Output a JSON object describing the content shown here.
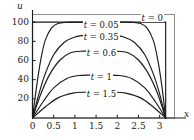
{
  "chart_data": {
    "type": "line",
    "title": "",
    "xlabel": "x",
    "ylabel": "u",
    "xlim": [
      0,
      3.35
    ],
    "ylim": [
      0,
      108
    ],
    "grid": false,
    "legend_position": "inline-on-curves",
    "xticks": [
      0,
      0.5,
      1,
      1.5,
      2,
      2.5,
      3
    ],
    "xtick_labels": [
      "0",
      "0.5",
      "1",
      "1.5",
      "2",
      "2.5",
      "3"
    ],
    "yticks": [
      20,
      40,
      60,
      80,
      100
    ],
    "ytick_labels": [
      "20",
      "40",
      "60",
      "80",
      "100"
    ],
    "domain_end": 3.14159,
    "series": [
      {
        "name": "t = 0",
        "t": 0,
        "label": "t = 0",
        "label_t": "t",
        "label_eq": "=",
        "label_value": "0",
        "peak": 100,
        "color": "#1a1a1a",
        "x": [
          0.0,
          0.001,
          0.08,
          0.4,
          0.8,
          1.2,
          1.5708,
          1.95,
          2.35,
          2.75,
          3.06,
          3.1406,
          3.14159
        ],
        "y": [
          0,
          100,
          100,
          100,
          100,
          100,
          100,
          100,
          100,
          100,
          100,
          100,
          0
        ]
      },
      {
        "name": "t = 0.05",
        "t": 0.05,
        "label": "t = 0.05",
        "label_t": "t",
        "label_eq": "=",
        "label_value": "0.05",
        "peak": 100,
        "color": "#1a1a1a",
        "x": [
          0.0,
          0.1,
          0.2,
          0.3,
          0.45,
          0.6,
          0.8,
          1.0,
          1.2,
          1.5708,
          1.95,
          2.15,
          2.35,
          2.55,
          2.7,
          2.85,
          2.95,
          3.05,
          3.14159
        ],
        "y": [
          0,
          34,
          62,
          81,
          94,
          98.6,
          99.8,
          100,
          100,
          100,
          100,
          100,
          99.8,
          98.6,
          94,
          81,
          62,
          34,
          0
        ]
      },
      {
        "name": "t = 0.35",
        "t": 0.35,
        "label": "t = 0.35",
        "label_t": "t",
        "label_eq": "=",
        "label_value": "0.35",
        "peak": 87,
        "color": "#1a1a1a",
        "x": [
          0.0,
          0.15,
          0.3,
          0.5,
          0.75,
          1.0,
          1.3,
          1.5708,
          1.85,
          2.15,
          2.4,
          2.65,
          2.85,
          3.0,
          3.14159
        ],
        "y": [
          0,
          25,
          46,
          66,
          79,
          84.5,
          86.7,
          87,
          86.7,
          84.5,
          79,
          66,
          46,
          25,
          0
        ]
      },
      {
        "name": "t = 0.6",
        "t": 0.6,
        "label": "t = 0.6",
        "label_t": "t",
        "label_eq": "=",
        "label_value": "0.6",
        "peak": 70,
        "color": "#1a1a1a",
        "x": [
          0.0,
          0.2,
          0.4,
          0.65,
          0.9,
          1.2,
          1.5708,
          1.95,
          2.25,
          2.5,
          2.75,
          2.95,
          3.14159
        ],
        "y": [
          0,
          25.5,
          45,
          60.5,
          68,
          69.8,
          70,
          69.8,
          68,
          60.5,
          45,
          25.5,
          0
        ]
      },
      {
        "name": "t = 1",
        "t": 1,
        "label": "t = 1",
        "label_t": "t",
        "label_eq": "=",
        "label_value": "1",
        "peak": 45,
        "color": "#1a1a1a",
        "x": [
          0.0,
          0.25,
          0.5,
          0.8,
          1.1,
          1.5708,
          2.05,
          2.35,
          2.65,
          2.9,
          3.14159
        ],
        "y": [
          0,
          17,
          31.5,
          41,
          44.3,
          45,
          44.3,
          41,
          31.5,
          17,
          0
        ]
      },
      {
        "name": "t = 1.5",
        "t": 1.5,
        "label": "t = 1.5",
        "label_t": "t",
        "label_eq": "=",
        "label_value": "1.5",
        "peak": 27,
        "color": "#1a1a1a",
        "x": [
          0.0,
          0.3,
          0.6,
          0.95,
          1.25,
          1.5708,
          1.9,
          2.2,
          2.55,
          2.85,
          3.14159
        ],
        "y": [
          0,
          11.5,
          21,
          26,
          26.9,
          27,
          26.9,
          26,
          21,
          11.5,
          0
        ]
      }
    ]
  },
  "axes": {
    "y_axis_name": "u",
    "x_axis_name": "x"
  },
  "colors": {
    "curve": "#1a1a1a",
    "frame": "#8a8a8a",
    "axis": "#1a1a1a",
    "background": "#ffffff"
  }
}
